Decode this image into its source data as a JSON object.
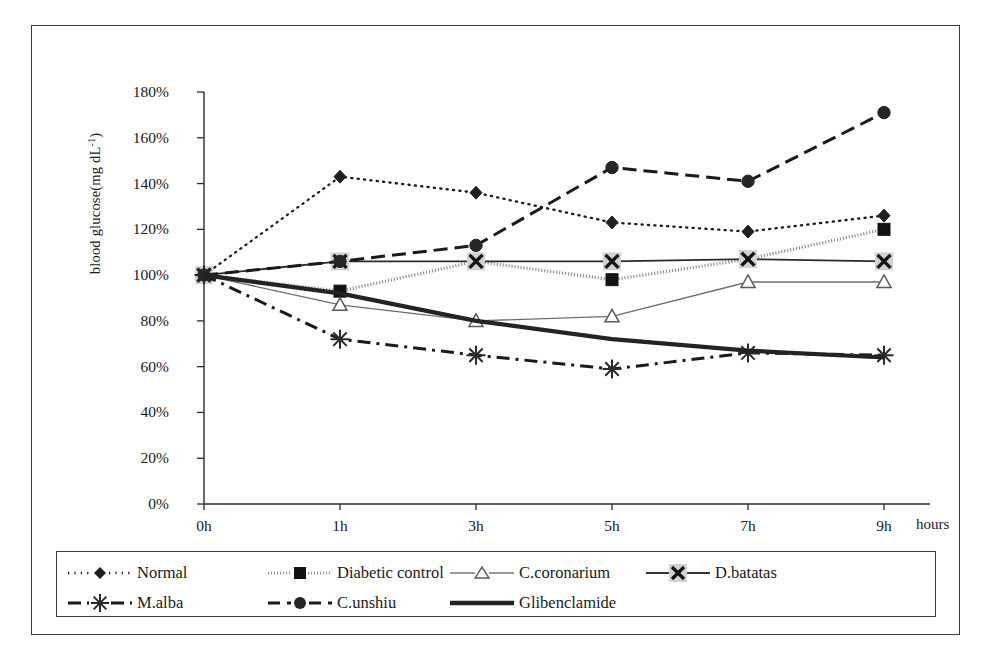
{
  "chart_data": {
    "type": "line",
    "title": "",
    "xlabel": "hours",
    "ylabel": "blood glucose(mg dL-1)",
    "ylabel_prefix": "blood glucose(mg dL",
    "ylabel_sup": "-1",
    "ylabel_suffix": ")",
    "categories": [
      "0h",
      "1h",
      "3h",
      "5h",
      "7h",
      "9h"
    ],
    "x_tick_labels": [
      "0h",
      "1h",
      "3h",
      "5h",
      "7h",
      "9h"
    ],
    "y_tick_labels": [
      "0%",
      "20%",
      "40%",
      "60%",
      "80%",
      "100%",
      "120%",
      "140%",
      "160%",
      "180%"
    ],
    "y_tick_values": [
      0,
      20,
      40,
      60,
      80,
      100,
      120,
      140,
      160,
      180
    ],
    "ylim": [
      0,
      180
    ],
    "grid": false,
    "legend_position": "bottom",
    "series": [
      {
        "name": "Normal",
        "values": [
          100,
          143,
          136,
          123,
          119,
          126
        ],
        "marker": "diamond",
        "line": "dotted",
        "color": "#1a1a1a"
      },
      {
        "name": "Diabetic control",
        "values": [
          100,
          93,
          106,
          98,
          107,
          120
        ],
        "marker": "square",
        "line": "speckled",
        "color": "#8a8a8a"
      },
      {
        "name": "C.coronarium",
        "values": [
          100,
          87,
          80,
          82,
          97,
          97
        ],
        "marker": "triangle",
        "line": "solid-thin",
        "color": "#6e6e6e"
      },
      {
        "name": "D.batatas",
        "values": [
          100,
          106,
          106,
          106,
          107,
          106
        ],
        "marker": "cross",
        "line": "solid",
        "color": "#2a2a2a"
      },
      {
        "name": "M.alba",
        "values": [
          100,
          72,
          65,
          59,
          66,
          65
        ],
        "marker": "asterisk",
        "line": "dash-dot",
        "color": "#1a1a1a"
      },
      {
        "name": "C.unshiu",
        "values": [
          100,
          106,
          113,
          147,
          141,
          171
        ],
        "marker": "circle",
        "line": "dashed",
        "color": "#1a1a1a"
      },
      {
        "name": "Glibenclamide",
        "values": [
          100,
          92,
          80,
          72,
          67,
          64
        ],
        "marker": "none",
        "line": "thick",
        "color": "#232323"
      }
    ]
  },
  "legend": {
    "rows": [
      [
        {
          "label": "Normal",
          "swatch": "dotted-diamond"
        },
        {
          "label": "Diabetic control",
          "swatch": "speckled-square"
        },
        {
          "label": "C.coronarium",
          "swatch": "thin-triangle"
        },
        {
          "label": "D.batatas",
          "swatch": "solid-cross"
        }
      ],
      [
        {
          "label": "M.alba",
          "swatch": "dashdot-asterisk"
        },
        {
          "label": "C.unshiu",
          "swatch": "dashed-circle"
        },
        {
          "label": "Glibenclamide",
          "swatch": "thick-solid"
        }
      ]
    ]
  },
  "axis": {
    "x_title": "hours"
  }
}
